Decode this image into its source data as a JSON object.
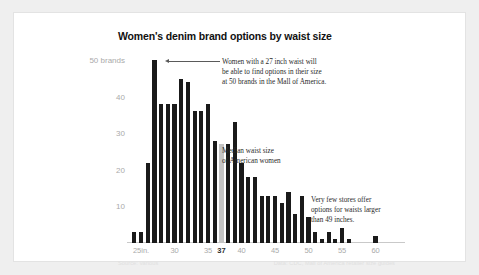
{
  "card": {
    "title": "Women's denim brand options by waist size"
  },
  "annotations": {
    "peak": [
      "Women with a 27 inch waist will",
      "be able to find options in their size",
      "at 50 brands in the Mall of America."
    ],
    "median": [
      "Median waist size",
      "of American women"
    ],
    "tail": [
      "Very few stores offer",
      "options for waists larger",
      "than 49 inches."
    ]
  },
  "footer": {
    "left": "Source: various",
    "right": "Data: CDC, Mall of America retailer size guides"
  },
  "colors": {
    "bar": "#1a1a1a",
    "bar_highlight": "#c4c4c4",
    "axis_text": "#aaaaaa",
    "card_bg": "#ffffff",
    "page_bg": "#efefef"
  },
  "chart_data": {
    "type": "bar",
    "title": "Women's denim brand options by waist size",
    "xlabel": "",
    "ylabel": "50 brands",
    "ylim": [
      0,
      52
    ],
    "xlim": [
      23.5,
      63.5
    ],
    "grid": false,
    "legend": "none",
    "y_ticks": [
      10,
      20,
      30,
      40,
      50
    ],
    "y_tick_labels": [
      "10",
      "20",
      "30",
      "40",
      "50 brands"
    ],
    "x_ticks": [
      25,
      30,
      35,
      37,
      40,
      45,
      50,
      55,
      60
    ],
    "x_tick_labels": [
      "25in.",
      "30",
      "35",
      "37",
      "40",
      "45",
      "50",
      "55",
      "60"
    ],
    "highlight_category": 37,
    "categories": [
      24,
      25,
      26,
      27,
      28,
      29,
      30,
      31,
      32,
      33,
      34,
      35,
      36,
      37,
      38,
      39,
      40,
      41,
      42,
      43,
      44,
      45,
      46,
      47,
      48,
      49,
      50,
      51,
      52,
      53,
      54,
      55,
      56,
      57,
      58,
      59,
      60,
      61,
      62,
      63
    ],
    "values": [
      3,
      3,
      22,
      50,
      38,
      38,
      38,
      45,
      44,
      36,
      36,
      38,
      28,
      27,
      27,
      33,
      22,
      18,
      18,
      13,
      13,
      13,
      11,
      14,
      8,
      13,
      7,
      3,
      1,
      3,
      1,
      4,
      1,
      0,
      0,
      0,
      2,
      0,
      0,
      0
    ],
    "notes": [
      "Peak of 50 brands occurs at a 27 inch waist.",
      "The bar at 37 inches is highlighted grey as the median waist size of American women.",
      "Very few stores offer options for waists larger than 49 inches."
    ]
  }
}
